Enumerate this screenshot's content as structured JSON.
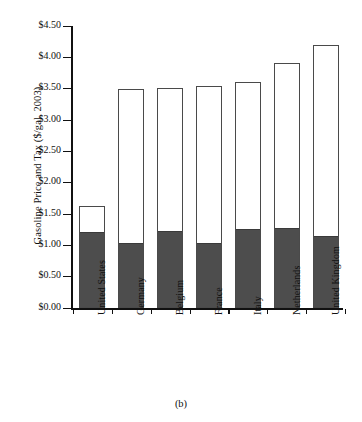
{
  "chart_data": {
    "type": "bar",
    "subtype": "stacked-bar",
    "title": "",
    "caption": "(b)",
    "xlabel": "",
    "ylabel": "Gasoline Price and Tax ($/gal, 2003)",
    "ylim": [
      0.0,
      4.5
    ],
    "ytick_labels": [
      "$0.00",
      "$0.50",
      "$1.00",
      "$1.50",
      "$2.00",
      "$2.50",
      "$3.00",
      "$3.50",
      "$4.00",
      "$4.50"
    ],
    "ytick_values": [
      0.0,
      0.5,
      1.0,
      1.5,
      2.0,
      2.5,
      3.0,
      3.5,
      4.0,
      4.5
    ],
    "grid": false,
    "legend": "none",
    "categories": [
      "United States",
      "Germany",
      "Belgium",
      "France",
      "Italy",
      "Netherlands",
      "United Kingdom"
    ],
    "series": [
      {
        "name": "Tax",
        "color": "#4d4d4d",
        "values": [
          1.18,
          1.0,
          1.2,
          1.01,
          1.23,
          1.25,
          1.11
        ]
      },
      {
        "name": "Pre-tax price",
        "color": "#ffffff",
        "values": [
          0.45,
          2.5,
          2.31,
          2.54,
          2.37,
          2.66,
          3.08
        ]
      }
    ],
    "totals": [
      1.63,
      3.5,
      3.51,
      3.55,
      3.6,
      3.91,
      4.19
    ]
  },
  "axis": {
    "y_title": "Gasoline Price and Tax ($/gal, 2003)"
  },
  "figure": {
    "caption": "(b)"
  }
}
